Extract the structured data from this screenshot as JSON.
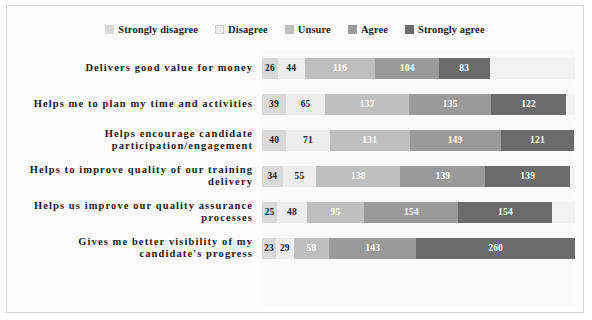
{
  "chart_data": {
    "type": "bar",
    "subtype": "stacked-horizontal",
    "title": "",
    "xlabel": "",
    "ylabel": "",
    "grid": false,
    "legend_position": "top-center",
    "stacked": true,
    "orientation": "horizontal",
    "categories": [
      "Delivers good value for money",
      "Helps me to plan my time and activities",
      "Helps encourage candidate participation/engagement",
      "Helps to improve quality of our training delivery",
      "Helps us improve our quality assurance processes",
      "Gives me better visibility of my candidate's progress"
    ],
    "series": [
      {
        "name": "Strongly disagree",
        "color": "#d9d9d9",
        "values": [
          26,
          39,
          40,
          34,
          25,
          23
        ]
      },
      {
        "name": "Disagree",
        "color": "#ededed",
        "values": [
          44,
          65,
          71,
          55,
          48,
          29
        ]
      },
      {
        "name": "Unsure",
        "color": "#bfbfbf",
        "values": [
          116,
          137,
          131,
          138,
          95,
          58
        ]
      },
      {
        "name": "Agree",
        "color": "#9a9a9a",
        "values": [
          104,
          135,
          149,
          139,
          154,
          143
        ]
      },
      {
        "name": "Strongly agree",
        "color": "#6b6b6b",
        "values": [
          83,
          122,
          121,
          139,
          154,
          260
        ]
      }
    ],
    "row_totals": [
      373,
      498,
      512,
      505,
      476,
      513
    ],
    "value_label_colors": {
      "on_light": "#1a1a1a",
      "on_dark": "#ffffff"
    }
  },
  "legend": {
    "items": [
      {
        "label": "Strongly disagree",
        "color": "#d9d9d9"
      },
      {
        "label": "Disagree",
        "color": "#ededed"
      },
      {
        "label": "Unsure",
        "color": "#bfbfbf"
      },
      {
        "label": "Agree",
        "color": "#9a9a9a"
      },
      {
        "label": "Strongly agree",
        "color": "#6b6b6b"
      }
    ]
  }
}
